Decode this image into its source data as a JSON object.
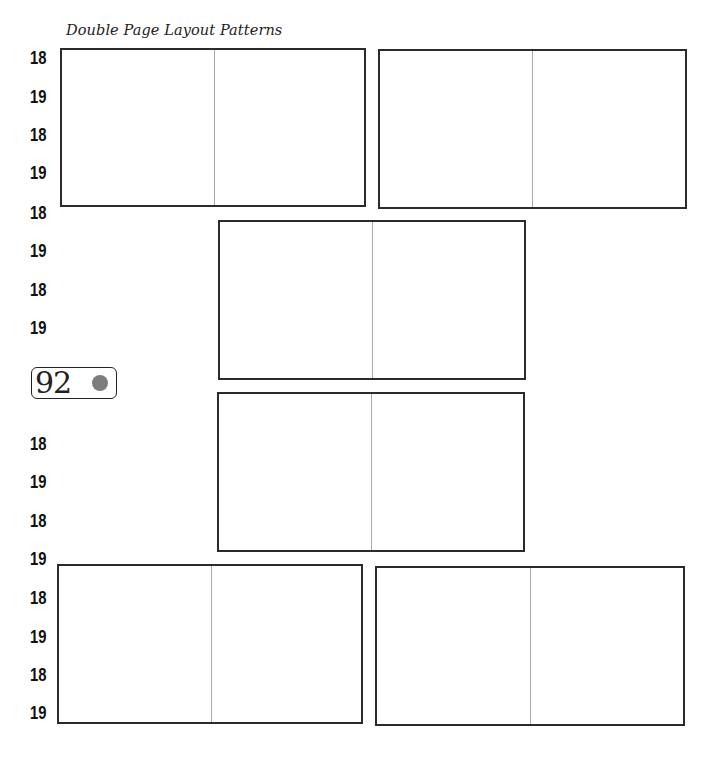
{
  "page": {
    "title": "Double Page Layout Patterns",
    "page_number": "92",
    "badge_dot_color": "#7d7d7d"
  },
  "side_labels": [
    "18",
    "19",
    "18",
    "19",
    "18",
    "19",
    "18",
    "19",
    "18",
    "19",
    "18",
    "19",
    "18",
    "19",
    "18",
    "19",
    "18",
    "19"
  ],
  "spreads": [
    {
      "id": "spread-1",
      "position": "top-left"
    },
    {
      "id": "spread-2",
      "position": "top-right"
    },
    {
      "id": "spread-3",
      "position": "middle-upper"
    },
    {
      "id": "spread-4",
      "position": "middle-lower"
    },
    {
      "id": "spread-5",
      "position": "bottom-left"
    },
    {
      "id": "spread-6",
      "position": "bottom-right"
    }
  ]
}
